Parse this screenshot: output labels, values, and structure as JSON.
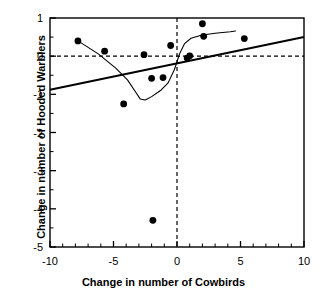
{
  "chart_data": {
    "type": "scatter",
    "title": "",
    "xlabel": "Change in number of Cowbirds",
    "ylabel": "Change in number of Hooded Warblers",
    "xlim": [
      -10,
      10
    ],
    "ylim": [
      -5,
      1
    ],
    "xticks": [
      -10,
      -5,
      0,
      5,
      10
    ],
    "yticks": [
      1,
      0,
      -1,
      -2,
      -3,
      -4,
      -5
    ],
    "xtick_labels": [
      "-10",
      "-5",
      "0",
      "5",
      "10"
    ],
    "ytick_labels": [
      "1",
      "0",
      "-1",
      "-2",
      "-3",
      "-4",
      "-5"
    ],
    "xminor_tick_interval": 1,
    "yminor_tick_interval": 0.5,
    "grid": false,
    "legend": null,
    "points": [
      {
        "x": -7.8,
        "y": 0.4
      },
      {
        "x": -5.7,
        "y": 0.13
      },
      {
        "x": -4.2,
        "y": -1.25
      },
      {
        "x": -2.6,
        "y": 0.04
      },
      {
        "x": -2.0,
        "y": -0.58
      },
      {
        "x": -1.9,
        "y": -4.3
      },
      {
        "x": -1.1,
        "y": -0.56
      },
      {
        "x": -0.5,
        "y": 0.28
      },
      {
        "x": 0.8,
        "y": -0.05
      },
      {
        "x": 1.0,
        "y": 0.01
      },
      {
        "x": 2.0,
        "y": 0.85
      },
      {
        "x": 2.1,
        "y": 0.52
      },
      {
        "x": 5.3,
        "y": 0.46
      }
    ],
    "reference_lines": [
      {
        "name": "zero-horizontal",
        "orientation": "horizontal",
        "value": 0,
        "style": "dashed"
      },
      {
        "name": "zero-vertical",
        "orientation": "vertical",
        "value": 0,
        "style": "dashed"
      }
    ],
    "series": [
      {
        "name": "regression-line",
        "type": "line",
        "style": "solid-thick",
        "points": [
          {
            "x": -10,
            "y": -0.88
          },
          {
            "x": 10,
            "y": 0.5
          }
        ]
      },
      {
        "name": "smoothed-fit-curve",
        "type": "line",
        "style": "solid-thin",
        "points": [
          {
            "x": -7.8,
            "y": 0.4
          },
          {
            "x": -6.2,
            "y": 0.06
          },
          {
            "x": -4.8,
            "y": -0.32
          },
          {
            "x": -3.9,
            "y": -0.62
          },
          {
            "x": -3.3,
            "y": -0.92
          },
          {
            "x": -2.9,
            "y": -1.12
          },
          {
            "x": -2.5,
            "y": -1.15
          },
          {
            "x": -2.0,
            "y": -1.06
          },
          {
            "x": -1.3,
            "y": -0.9
          },
          {
            "x": -0.7,
            "y": -0.7
          },
          {
            "x": -0.2,
            "y": -0.35
          },
          {
            "x": 0.2,
            "y": 0.06
          },
          {
            "x": 0.6,
            "y": 0.33
          },
          {
            "x": 1.1,
            "y": 0.47
          },
          {
            "x": 1.9,
            "y": 0.55
          },
          {
            "x": 3.0,
            "y": 0.6
          },
          {
            "x": 4.2,
            "y": 0.64
          },
          {
            "x": 4.6,
            "y": 0.66
          }
        ]
      }
    ],
    "colors": {
      "marker": "#000000",
      "axis": "#000000",
      "regression": "#000000",
      "curve": "#000000"
    }
  }
}
